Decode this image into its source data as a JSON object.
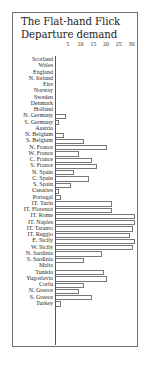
{
  "chart_data": {
    "type": "bar",
    "orientation": "horizontal",
    "title": "The Flat-hand Flick Departure demand",
    "xlabel": "",
    "ylabel": "",
    "xlim": [
      0,
      32
    ],
    "x_ticks": [
      5,
      10,
      15,
      20,
      25,
      30
    ],
    "grid": false,
    "legend": null,
    "categories": [
      "Scotland",
      "Wales",
      "England",
      "N. Ireland",
      "Eire",
      "Norway",
      "Sweden",
      "Denmark",
      "Holland",
      "N. Germany",
      "S. Germany",
      "Austria",
      "N. Belgium",
      "S. Belgium",
      "N. France",
      "W. France",
      "C. France",
      "S. France",
      "N. Spain",
      "C. Spain",
      "S. Spain",
      "Canaries",
      "Portugal",
      "IT. Turin",
      "IT. Florence",
      "IT. Rome",
      "IT. Naples",
      "IT. Taranto",
      "IT. Reggio",
      "E. Sicily",
      "W. Sicily",
      "N. Sardinia",
      "S. Sardinia",
      "Malta",
      "Tunisia",
      "Yugoslavia",
      "Corfu",
      "N. Greece",
      "S. Greece",
      "Turkey"
    ],
    "values": [
      0,
      0,
      0,
      0,
      0,
      0,
      0,
      0,
      0,
      4,
      1,
      0,
      3,
      11,
      20,
      9,
      14,
      16,
      7,
      13,
      6,
      1,
      2,
      22,
      22,
      31,
      31,
      30,
      29,
      31,
      30,
      18,
      11,
      0,
      19,
      20,
      11,
      9,
      14,
      2
    ]
  },
  "colors": {
    "frame": "#6f6f6f",
    "bar_outline": "#777777",
    "text": "#1e1e1e"
  },
  "layout": {
    "px_per_unit": 2.55,
    "row_height": 6.25,
    "axis_x": 42
  }
}
